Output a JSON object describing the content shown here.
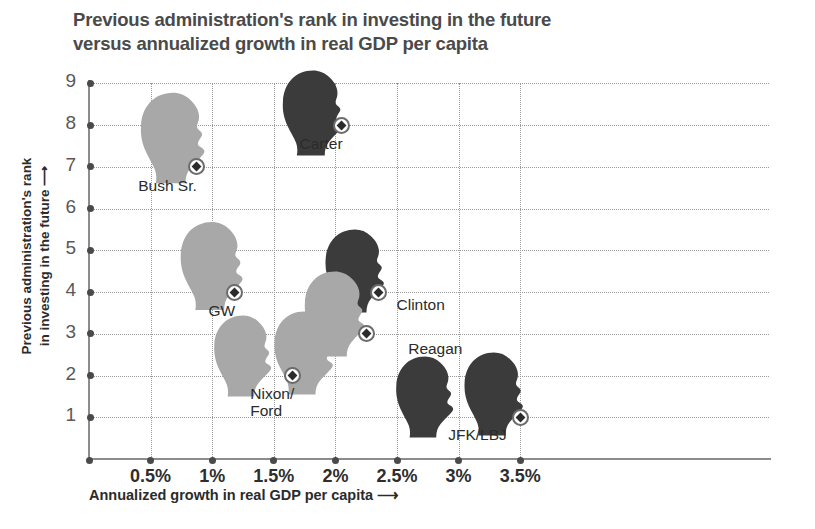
{
  "chart": {
    "title": "Previous administration's rank in investing in the future versus annualized growth in real GDP per capita",
    "title_line1": "Previous administration's rank in investing in the future",
    "title_line2": "versus annualized growth in real GDP per capita",
    "ylabel": "Previous administration's rank\nin investing in the future —→",
    "ylabel_line1": "Previous administration's rank",
    "ylabel_line2": "in investing in the future",
    "xlabel": "Annualized growth in real GDP per capita",
    "arrow": "→"
  },
  "chart_data": {
    "type": "scatter",
    "title": "Previous administration's rank in investing in the future versus annualized growth in real GDP per capita",
    "xlabel": "Annualized growth in real GDP per capita",
    "ylabel": "Previous administration's rank in investing in the future",
    "xlim": [
      0,
      3.6
    ],
    "ylim": [
      0,
      9
    ],
    "grid": true,
    "legend": "none",
    "xticks": [
      "0.5%",
      "1%",
      "1.5%",
      "2%",
      "2.5%",
      "3%",
      "3.5%"
    ],
    "xtick_values": [
      0.5,
      1,
      1.5,
      2,
      2.5,
      3,
      3.5
    ],
    "yticks": [
      "1",
      "2",
      "3",
      "4",
      "5",
      "6",
      "7",
      "8",
      "9"
    ],
    "ytick_values": [
      1,
      2,
      3,
      4,
      5,
      6,
      7,
      8,
      9
    ],
    "points": [
      {
        "label": "Bush Sr.",
        "x": 0.87,
        "y": 7,
        "shade": "light",
        "heads": 1
      },
      {
        "label": "Carter",
        "x": 2.05,
        "y": 8,
        "shade": "dark",
        "heads": 1
      },
      {
        "label": "GW",
        "x": 1.18,
        "y": 4,
        "shade": "light",
        "heads": 1
      },
      {
        "label": "Clinton",
        "x": 2.35,
        "y": 4,
        "shade": "dark",
        "heads": 1
      },
      {
        "label": "Reagan",
        "x": 2.25,
        "y": 3,
        "shade": "light",
        "heads": 1
      },
      {
        "label": "Nixon/\nFord",
        "x": 1.65,
        "y": 2,
        "shade": "light",
        "heads": 2
      },
      {
        "label": "JFK/LBJ",
        "x": 3.5,
        "y": 1,
        "shade": "dark",
        "heads": 2
      }
    ]
  },
  "labels": {
    "bush_sr": "Bush Sr.",
    "carter": "Carter",
    "gw": "GW",
    "clinton": "Clinton",
    "reagan": "Reagan",
    "nixon_ford_line1": "Nixon/",
    "nixon_ford_line2": "Ford",
    "jfk_lbj": "JFK/LBJ"
  },
  "ticks": {
    "y": [
      "9",
      "8",
      "7",
      "6",
      "5",
      "4",
      "3",
      "2",
      "1"
    ],
    "x": [
      "0.5%",
      "1%",
      "1.5%",
      "2%",
      "2.5%",
      "3%",
      "3.5%"
    ]
  },
  "colors": {
    "head_light": "#a8a8a8",
    "head_dark": "#3b3b3b",
    "axis": "#8c8c8c",
    "grid": "#9a9a9a",
    "title": "#4a4a4a",
    "text": "#2b2b2b"
  }
}
